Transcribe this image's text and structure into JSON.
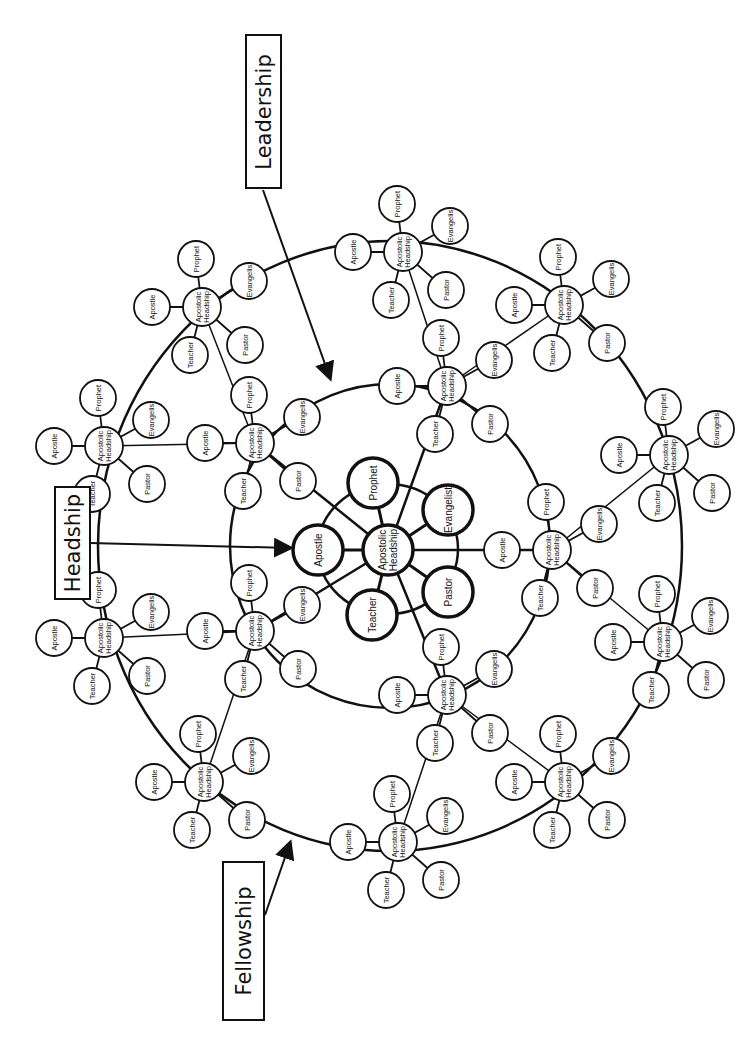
{
  "title_labels": {
    "leadership": "Leadership",
    "headship": "Headship",
    "fellowship": "Fellowship"
  },
  "node_labels": {
    "hub_line1": "Apostolic",
    "hub_line2": "Headship",
    "apostle": "Apostle",
    "prophet": "Prophet",
    "evangelist_center": "Evangelist",
    "evangelist_small": "Evangelis",
    "pastor": "Pastor",
    "teacher": "Teacher"
  },
  "center_cluster": {
    "hub": [
      388,
      550
    ],
    "satellites": {
      "apostle": [
        318,
        550
      ],
      "prophet": [
        373,
        483
      ],
      "evangelist": [
        448,
        510
      ],
      "pastor": [
        448,
        592
      ],
      "teacher": [
        372,
        615
      ]
    }
  },
  "rings": {
    "center": [
      390,
      546
    ],
    "inner_r": [
      160,
      162
    ],
    "outer_r": [
      292,
      305
    ],
    "small_r": [
      70,
      65
    ]
  },
  "inner_hubs": [
    [
      255,
      443
    ],
    [
      255,
      631
    ],
    [
      447,
      386
    ],
    [
      447,
      695
    ],
    [
      552,
      550
    ]
  ],
  "outer_hubs": [
    [
      104,
      446
    ],
    [
      104,
      638
    ],
    [
      202,
      307
    ],
    [
      204,
      782
    ],
    [
      403,
      252
    ],
    [
      398,
      842
    ],
    [
      564,
      305
    ],
    [
      564,
      782
    ],
    [
      669,
      455
    ],
    [
      663,
      642
    ]
  ],
  "colors": {
    "ink": "#111111",
    "paper": "#ffffff"
  }
}
